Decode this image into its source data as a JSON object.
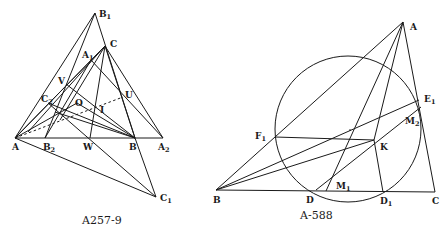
{
  "figures": [
    {
      "id": "left",
      "caption": "A257-9",
      "points": {
        "A": {
          "label": "A",
          "sub": ""
        },
        "B": {
          "label": "B",
          "sub": ""
        },
        "C": {
          "label": "C",
          "sub": ""
        },
        "A1": {
          "label": "A",
          "sub": "1"
        },
        "A2": {
          "label": "A",
          "sub": "2"
        },
        "B1": {
          "label": "B",
          "sub": "1"
        },
        "B2": {
          "label": "B",
          "sub": "2"
        },
        "C1": {
          "label": "C",
          "sub": "1"
        },
        "C2": {
          "label": "C",
          "sub": "2"
        },
        "O": {
          "label": "O",
          "sub": ""
        },
        "I": {
          "label": "I",
          "sub": ""
        },
        "U": {
          "label": "U",
          "sub": ""
        },
        "V": {
          "label": "V",
          "sub": ""
        },
        "W": {
          "label": "W",
          "sub": ""
        }
      }
    },
    {
      "id": "right",
      "caption": "A-588",
      "points": {
        "A": {
          "label": "A",
          "sub": ""
        },
        "B": {
          "label": "B",
          "sub": ""
        },
        "C": {
          "label": "C",
          "sub": ""
        },
        "D": {
          "label": "D",
          "sub": ""
        },
        "D1": {
          "label": "D",
          "sub": "1"
        },
        "E1": {
          "label": "E",
          "sub": "1"
        },
        "F1": {
          "label": "F",
          "sub": "1"
        },
        "K": {
          "label": "K",
          "sub": ""
        },
        "M1": {
          "label": "M",
          "sub": "1"
        },
        "M2": {
          "label": "M",
          "sub": "2"
        }
      }
    }
  ]
}
